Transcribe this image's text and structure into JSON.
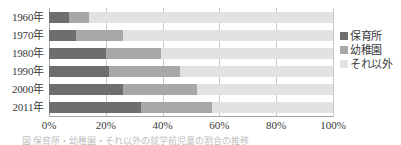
{
  "chart_data": {
    "type": "bar",
    "orientation": "horizontal",
    "stacked": true,
    "stacked_percent": true,
    "title": "",
    "xlabel": "",
    "ylabel": "",
    "xlim": [
      0,
      100
    ],
    "grid": true,
    "legend_position": "right",
    "categories": [
      "1960年",
      "1970年",
      "1980年",
      "1990年",
      "2000年",
      "2011年"
    ],
    "xticks": [
      0,
      20,
      40,
      60,
      80,
      100
    ],
    "xticklabels": [
      "0%",
      "20%",
      "40%",
      "60%",
      "80%",
      "100%"
    ],
    "series": [
      {
        "name": "保育所",
        "color": "#6e6e6e",
        "values": [
          7.0,
          9.5,
          20.0,
          21.0,
          26.0,
          32.5
        ]
      },
      {
        "name": "幼稚園",
        "color": "#a8a8a8",
        "values": [
          7.0,
          16.5,
          19.5,
          25.0,
          26.0,
          25.0
        ]
      },
      {
        "name": "それ以外",
        "color": "#e2e2e2",
        "values": [
          86.0,
          74.0,
          60.5,
          54.0,
          48.0,
          42.5
        ]
      }
    ],
    "cumulative_edges": [
      [
        7.0,
        14.0,
        100.0
      ],
      [
        9.5,
        26.0,
        100.0
      ],
      [
        20.0,
        39.5,
        100.0
      ],
      [
        21.0,
        46.0,
        100.0
      ],
      [
        26.0,
        52.0,
        100.0
      ],
      [
        32.5,
        57.5,
        100.0
      ]
    ]
  },
  "legend": {
    "items": [
      {
        "label": "保育所",
        "color": "#6e6e6e"
      },
      {
        "label": "幼稚園",
        "color": "#a8a8a8"
      },
      {
        "label": "それ以外",
        "color": "#e2e2e2"
      }
    ]
  },
  "caption": {
    "text": "図 保育所・幼稚園・それ以外の就学前児童の割合の推移"
  },
  "colors": {
    "background": "#ffffff",
    "gridline": "#c8c8c8",
    "axis": "#a8a8a8",
    "text": "#3a3a3a"
  }
}
